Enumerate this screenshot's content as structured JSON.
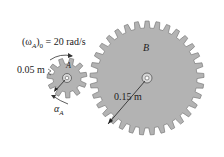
{
  "diagram": {
    "gear_a": {
      "label": "A",
      "radius_label": "0.05 m",
      "omega_label": "(ω",
      "omega_sub": "A",
      "omega_rest": ")",
      "omega_sub0": "0",
      "omega_value": " = 20 rad/s",
      "alpha": "α",
      "alpha_sub": "A"
    },
    "gear_b": {
      "label": "B",
      "radius_label": "0.15 m"
    },
    "colors": {
      "gear_fill": "#b3b3b3",
      "gear_stroke": "#7a7a7a",
      "text": "#222222"
    }
  }
}
